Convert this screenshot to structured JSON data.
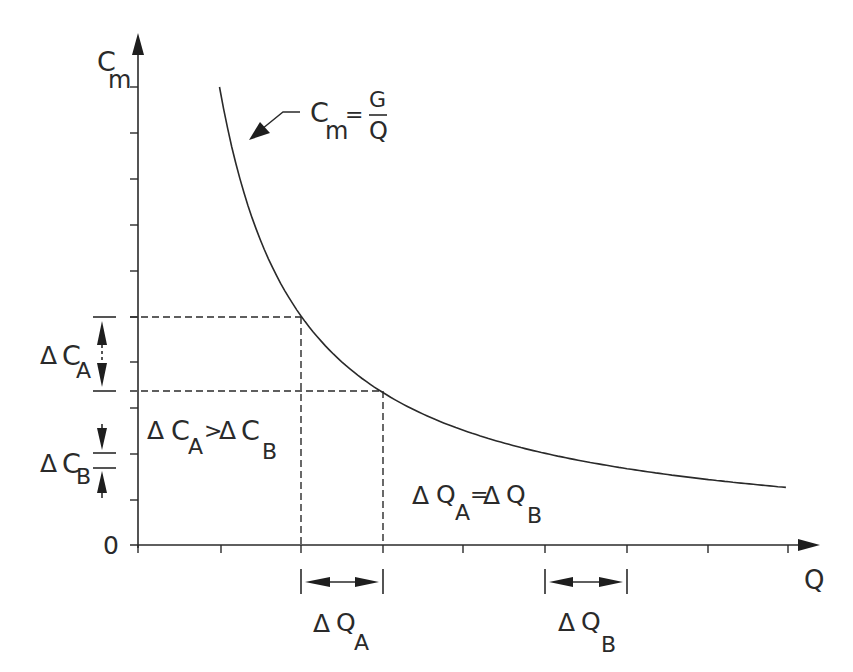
{
  "chart_data": {
    "type": "line",
    "title": "",
    "xlabel": "Q",
    "ylabel": "C_m",
    "origin_label": "0",
    "equation": "C_m = G / Q",
    "grid": false,
    "x_ticks": 8,
    "y_ticks": 10,
    "series": [
      {
        "name": "C_m = G/Q",
        "x": [
          1,
          1.5,
          2,
          2.5,
          3,
          4,
          5,
          6,
          7,
          7.95
        ],
        "y": [
          10,
          6.67,
          5,
          4,
          3.33,
          2.5,
          2,
          1.67,
          1.43,
          1.26
        ]
      }
    ],
    "annotations": [
      {
        "label": "ΔC_A",
        "from_y": 5,
        "to_y": 3.33,
        "between_x": [
          2,
          3
        ]
      },
      {
        "label": "ΔC_B",
        "from_y": 1.9,
        "to_y": 1.67
      },
      {
        "label": "ΔQ_A",
        "from_x": 2,
        "to_x": 3
      },
      {
        "label": "ΔQ_B",
        "from_x": 5,
        "to_x": 6
      },
      {
        "text": "ΔC_A > ΔC_B"
      },
      {
        "text": "ΔQ_A = ΔQ_B"
      }
    ]
  },
  "axes": {
    "y_label": {
      "main": "C",
      "sub": "m"
    },
    "x_label": "Q",
    "origin": "0"
  },
  "equation": {
    "lhs_main": "C",
    "lhs_sub": "m",
    "eq": "=",
    "numerator": "G",
    "denominator": "Q"
  },
  "labels": {
    "delta": "Δ",
    "dCA": {
      "main": "C",
      "sub": "A"
    },
    "dCB": {
      "main": "C",
      "sub": "B"
    },
    "dQA": {
      "main": "Q",
      "sub": "A"
    },
    "dQB": {
      "main": "Q",
      "sub": "B"
    },
    "compare_c": {
      "op": ">"
    },
    "compare_q": {
      "op": "="
    }
  },
  "colors": {
    "ink": "#2a2a2a",
    "background": "#ffffff"
  }
}
